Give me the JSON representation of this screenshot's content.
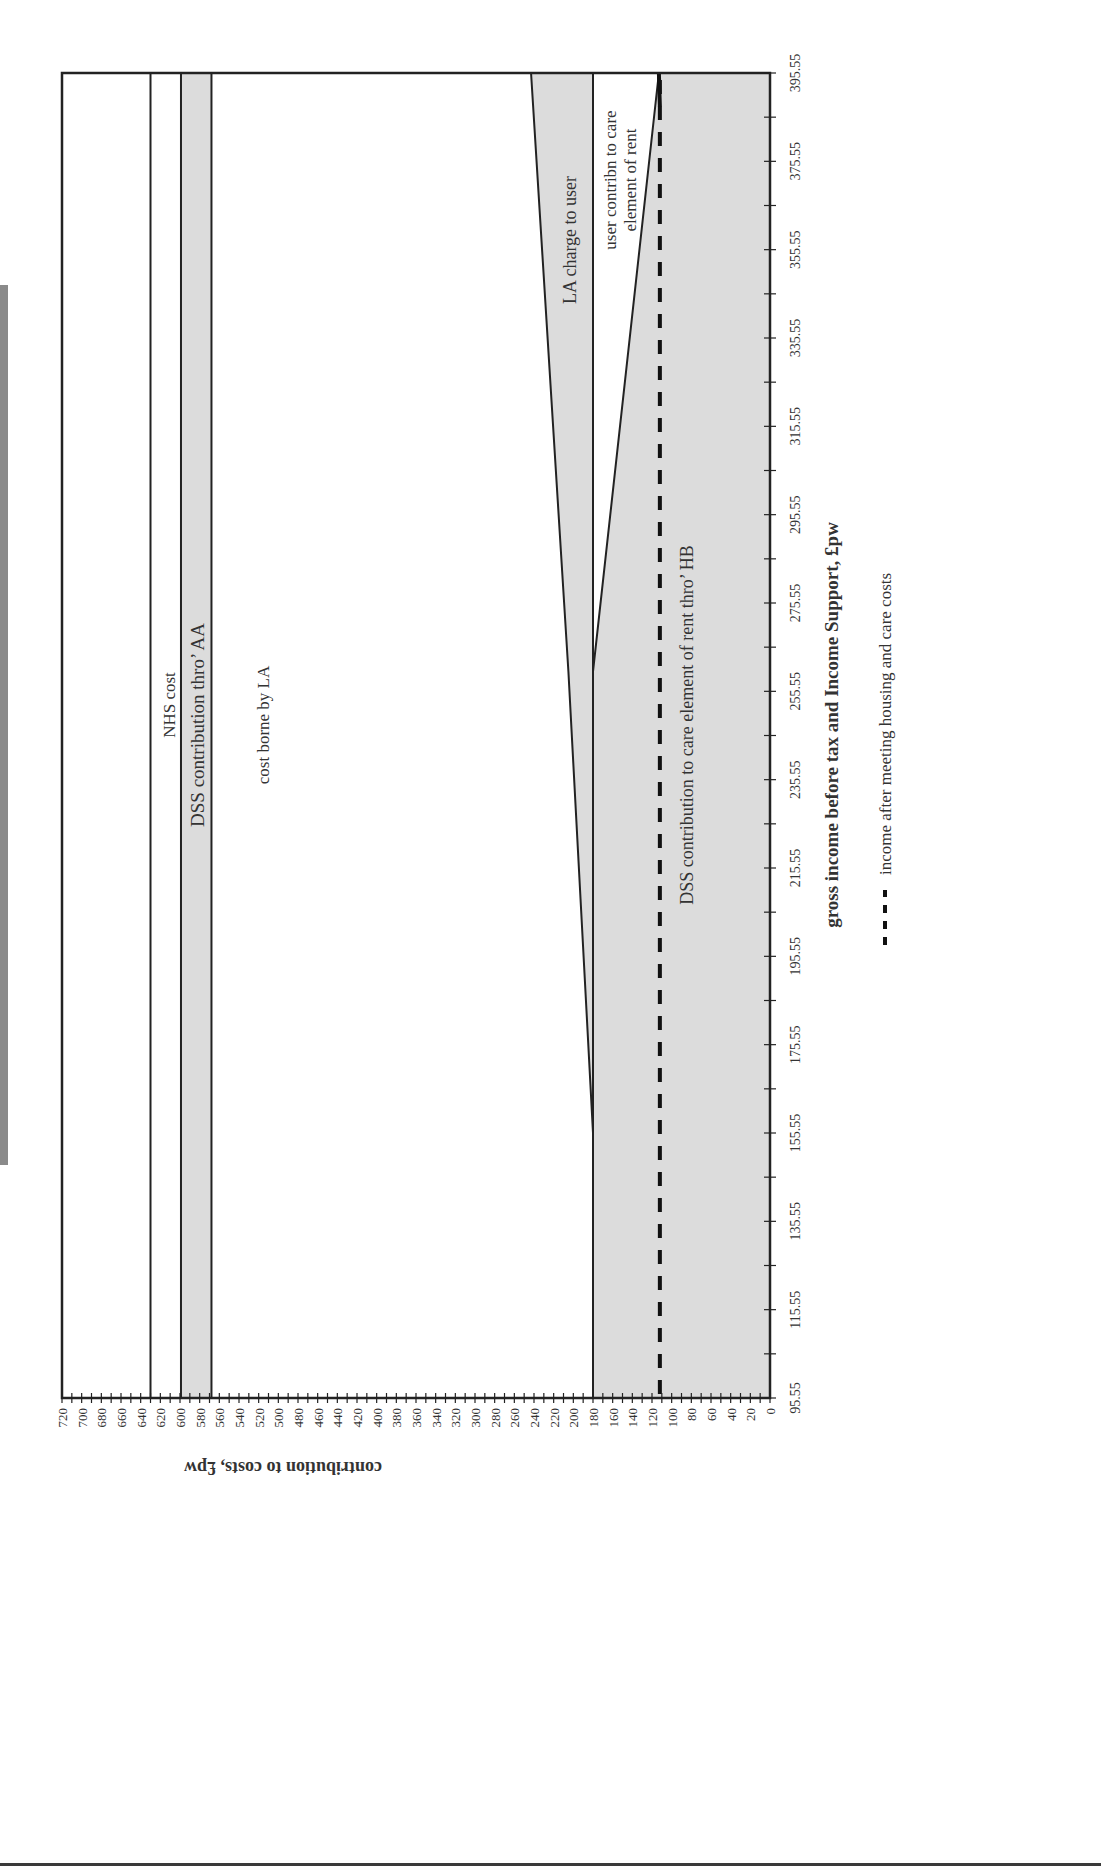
{
  "chart_data": {
    "type": "area",
    "orientation": "rotated-90-clockwise",
    "title": "",
    "xlabel": "gross income before tax and Income Support, £pw",
    "ylabel": "contribution to costs, £pw",
    "x_ticks": [
      "95.55",
      "115.55",
      "135.55",
      "155.55",
      "175.55",
      "195.55",
      "215.55",
      "235.55",
      "255.55",
      "275.55",
      "295.55",
      "315.55",
      "335.55",
      "355.55",
      "375.55",
      "395.55"
    ],
    "y_ticks": [
      0,
      20,
      40,
      60,
      80,
      100,
      120,
      140,
      160,
      180,
      200,
      220,
      240,
      260,
      280,
      300,
      320,
      340,
      360,
      380,
      400,
      420,
      440,
      460,
      480,
      500,
      520,
      540,
      560,
      580,
      600,
      620,
      640,
      660,
      680,
      700,
      720
    ],
    "xlim": [
      95.55,
      395.55
    ],
    "ylim": [
      0,
      720
    ],
    "x": [
      95.55,
      155.55,
      260,
      395.55
    ],
    "series": [
      {
        "name": "DSS contribution to care element of rent thro' HB",
        "fill": "shaded",
        "lower": [
          0,
          0,
          0,
          0
        ],
        "upper": [
          180,
          180,
          180,
          113
        ]
      },
      {
        "name": "user contribn to care element of rent",
        "fill": "white",
        "lower": [
          180,
          180,
          180,
          113
        ],
        "upper": [
          180,
          180,
          180,
          180
        ]
      },
      {
        "name": "LA charge to user",
        "fill": "shaded",
        "lower": [
          180,
          180,
          180,
          180
        ],
        "upper": [
          180,
          180,
          205,
          243
        ]
      },
      {
        "name": "cost borne by LA",
        "fill": "white",
        "lower": [
          180,
          180,
          205,
          243
        ],
        "upper": [
          568,
          568,
          568,
          568
        ]
      },
      {
        "name": "DSS contribution thro' AA",
        "fill": "shaded",
        "lower": [
          568,
          568,
          568,
          568
        ],
        "upper": [
          599,
          599,
          599,
          599
        ]
      },
      {
        "name": "(unlabelled band)",
        "fill": "white",
        "lower": [
          599,
          599,
          599,
          599
        ],
        "upper": [
          630,
          630,
          630,
          630
        ]
      },
      {
        "name": "NHS cost",
        "fill": "white",
        "lower": [
          630,
          630,
          630,
          630
        ],
        "upper": [
          720,
          720,
          720,
          720
        ]
      }
    ],
    "lines": [
      {
        "name": "income after meeting housing and care costs",
        "style": "dashed",
        "x": [
          95.55,
          395.55
        ],
        "y": [
          112,
          112
        ]
      }
    ],
    "legend": {
      "position": "right-bottom",
      "entries": [
        "income after meeting housing and care costs"
      ]
    },
    "grid": false,
    "annotations": [
      "NHS cost",
      "DSS contribution thro' AA",
      "cost borne by LA",
      "LA charge to user",
      "user contribn to care",
      "element of rent",
      "DSS contribution to care element of rent thro' HB"
    ]
  },
  "labels": {
    "nhs": "NHS cost",
    "dss_aa": "DSS contribution thro’ AA",
    "la_cost": "cost borne by LA",
    "la_charge": "LA charge to user",
    "user_contrib_1": "user contribn to care",
    "user_contrib_2": "element of rent",
    "dss_hb": "DSS contribution to care element of rent thro’ HB",
    "x_title": "gross income before tax and Income Support, £pw",
    "y_title": "contribution to costs, £pw",
    "legend": "income after meeting housing and care costs"
  },
  "colors": {
    "shade": "#dcdcdc",
    "line": "#222222",
    "dash": "#111111",
    "text": "#333333"
  }
}
